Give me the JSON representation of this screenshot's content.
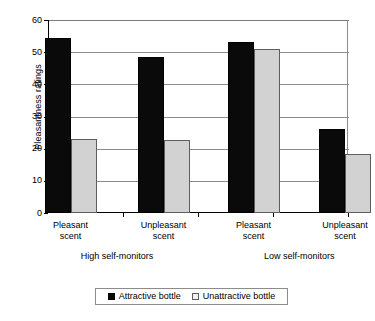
{
  "chart_data": {
    "type": "bar",
    "title": "",
    "xlabel": "",
    "ylabel": "Pleasantness ratings",
    "ylim": [
      0,
      60
    ],
    "yticks": [
      0,
      10,
      20,
      30,
      40,
      50,
      60
    ],
    "grid": true,
    "legend_position": "bottom",
    "categories": [
      "Pleasant scent",
      "Unpleasant scent",
      "Pleasant scent",
      "Unpleasant scent"
    ],
    "category_lines": [
      {
        "line1": "Pleasant",
        "line2": "scent"
      },
      {
        "line1": "Unpleasant",
        "line2": "scent"
      },
      {
        "line1": "Pleasant",
        "line2": "scent"
      },
      {
        "line1": "Unpleasant",
        "line2": "scent"
      }
    ],
    "groups": [
      {
        "label": "High self-monitors",
        "categories": [
          0,
          1
        ]
      },
      {
        "label": "Low self-monitors",
        "categories": [
          2,
          3
        ]
      }
    ],
    "series": [
      {
        "name": "Attractive bottle",
        "color": "#0a0a0a",
        "values": [
          54.5,
          48.5,
          53.2,
          26.2
        ]
      },
      {
        "name": "Unattractive bottle",
        "color": "#d2d2d2",
        "values": [
          23.1,
          22.6,
          51.0,
          18.2
        ]
      }
    ]
  },
  "legend": {
    "items": [
      {
        "label": "Attractive bottle",
        "swatch": "filled-black-square"
      },
      {
        "label": "Unattractive bottle",
        "swatch": "open-light-square"
      }
    ]
  },
  "axis": {
    "y_title": "Pleasantness ratings",
    "y_tick_labels": [
      "60",
      "50",
      "40",
      "30",
      "20",
      "10",
      "0"
    ]
  }
}
